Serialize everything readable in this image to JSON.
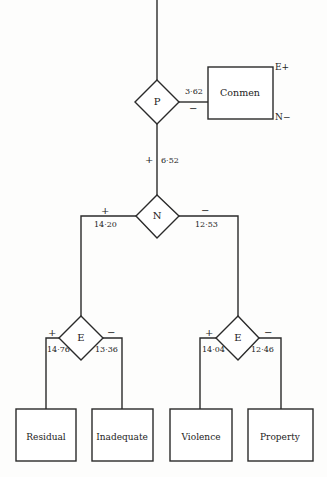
{
  "diagram": {
    "colors": {
      "line": "#2a2a2a",
      "background": "#fdfdfc",
      "text": "#222222"
    },
    "nodes": {
      "P": {
        "label": "P",
        "type": "diamond"
      },
      "N": {
        "label": "N",
        "type": "diamond"
      },
      "E_left": {
        "label": "E",
        "type": "diamond"
      },
      "E_right": {
        "label": "E",
        "type": "diamond"
      }
    },
    "boxes": {
      "conmen": {
        "label": "Conmen",
        "top_right_tag": "E+",
        "bottom_right_tag": "N−"
      },
      "residual": {
        "label": "Residual"
      },
      "inadequate": {
        "label": "Inadequate"
      },
      "violence": {
        "label": "Violence"
      },
      "property": {
        "label": "Property"
      }
    },
    "edges": {
      "P_to_conmen": {
        "sign": "−",
        "value": "3·62"
      },
      "P_to_N": {
        "sign": "+",
        "value": "6·52"
      },
      "N_left": {
        "sign": "+",
        "value": "14·20"
      },
      "N_right": {
        "sign": "−",
        "value": "12·53"
      },
      "E_left_plus": {
        "sign": "+",
        "value": "14·76"
      },
      "E_left_minus": {
        "sign": "−",
        "value": "13·36"
      },
      "E_right_plus": {
        "sign": "+",
        "value": "14·04"
      },
      "E_right_minus": {
        "sign": "−",
        "value": "12·46"
      }
    }
  }
}
